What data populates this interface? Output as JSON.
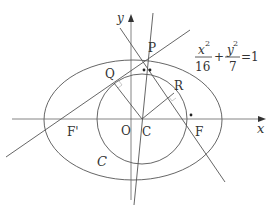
{
  "diagram": {
    "equation": {
      "x_num": "x",
      "x_exp": "2",
      "x_den": "16",
      "plus": "+",
      "y_num": "y",
      "y_exp": "2",
      "y_den": "7",
      "equals": "=1"
    },
    "axes": {
      "x_label": "x",
      "y_label": "y"
    },
    "points": {
      "P": "P",
      "Q": "Q",
      "R": "R",
      "O": "O",
      "C": "C",
      "F": "F",
      "F_prime": "F'"
    },
    "curve_label": "C",
    "colors": {
      "line": "#555555",
      "text": "#333333",
      "right_angle": "#bbbbbb"
    }
  }
}
